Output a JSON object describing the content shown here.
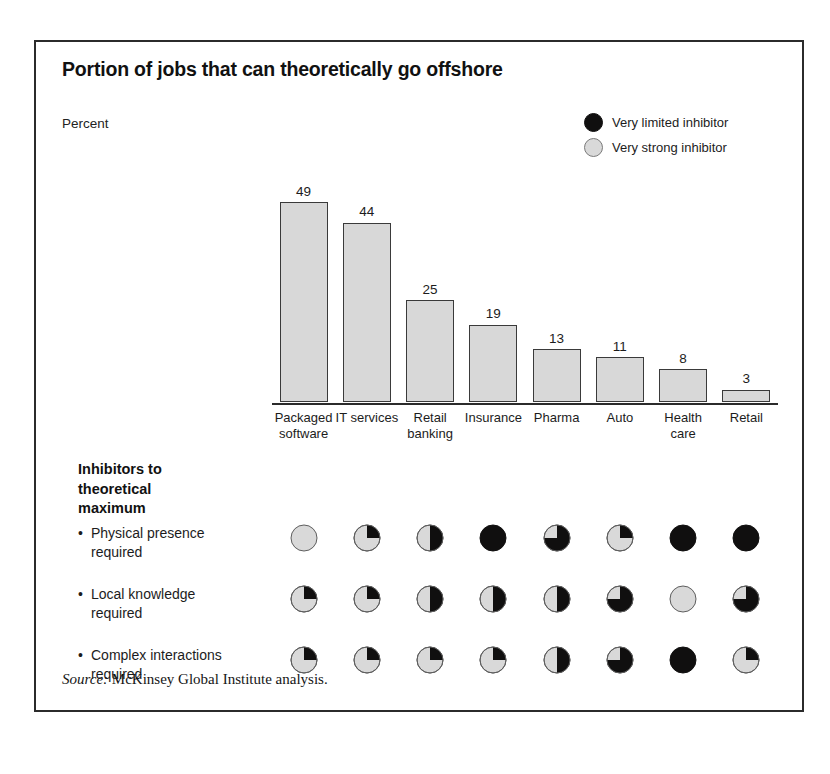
{
  "title": "Portion of jobs that can theoretically go offshore",
  "unit_label": "Percent",
  "legend": {
    "items": [
      {
        "label": "Very limited inhibitor",
        "icon": "filled-circle-icon",
        "color": "#100f0f"
      },
      {
        "label": "Very strong inhibitor",
        "icon": "empty-circle-icon",
        "color": "#d9d9d9"
      }
    ]
  },
  "inhibitors_heading": "Inhibitors to theoretical maximum",
  "bullet_glyph": "•",
  "source": {
    "prefix": "Source:",
    "text": "McKinsey Global Institute analysis."
  },
  "chart_data": {
    "type": "bar",
    "title": "Portion of jobs that can theoretically go offshore",
    "subtitle": "",
    "xlabel": "",
    "ylabel": "Percent",
    "ylim": [
      0,
      52
    ],
    "grid": false,
    "legend_position": "top-right",
    "categories": [
      "Packaged software",
      "IT services",
      "Retail banking",
      "Insurance",
      "Pharma",
      "Auto",
      "Health care",
      "Retail"
    ],
    "category_lines": [
      [
        "Packaged",
        "software"
      ],
      [
        "IT services"
      ],
      [
        "Retail",
        "banking"
      ],
      [
        "Insurance"
      ],
      [
        "Pharma"
      ],
      [
        "Auto"
      ],
      [
        "Health",
        "care"
      ],
      [
        "Retail"
      ]
    ],
    "values": [
      49,
      44,
      25,
      19,
      13,
      11,
      8,
      3
    ],
    "value_labels": [
      "49",
      "44",
      "25",
      "19",
      "13",
      "11",
      "8",
      "3"
    ],
    "bar_fill": "#d8d8d8",
    "bar_stroke": "#3a3a3a",
    "harvey_balls": {
      "scale_note": "fill fraction 0 = very strong inhibitor (empty/light), 1 = very limited inhibitor (full/dark)",
      "rows": [
        {
          "label": "Physical presence required",
          "label_lines": [
            "Physical presence",
            "required"
          ],
          "fills": [
            0,
            0.25,
            0.5,
            1,
            0.75,
            0.25,
            1,
            1
          ]
        },
        {
          "label": "Local knowledge required",
          "label_lines": [
            "Local knowledge",
            "required"
          ],
          "fills": [
            0.25,
            0.25,
            0.5,
            0.5,
            0.5,
            0.75,
            0,
            0.75
          ]
        },
        {
          "label": "Complex interactions required",
          "label_lines": [
            "Complex interactions",
            "required"
          ],
          "fills": [
            0.25,
            0.25,
            0.25,
            0.25,
            0.5,
            0.75,
            1,
            0.25
          ]
        }
      ]
    }
  }
}
